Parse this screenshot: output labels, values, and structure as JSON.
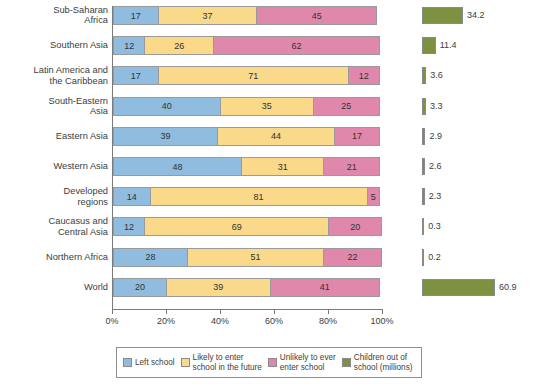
{
  "chart_data": {
    "type": "bar",
    "orientation": "horizontal",
    "subtype": "100% stacked bar with companion magnitude bars",
    "title": "",
    "xlabel": "",
    "ylabel": "",
    "xlim": [
      0,
      100
    ],
    "xticks": [
      "0%",
      "20%",
      "40%",
      "60%",
      "80%",
      "100%"
    ],
    "xtick_values": [
      0,
      20,
      40,
      60,
      80,
      100
    ],
    "grid": false,
    "legend_position": "bottom",
    "categories": [
      "Sub-Saharan\nAfrica",
      "Southern Asia",
      "Latin America and\nthe Caribbean",
      "South-Eastern\nAsia",
      "Eastern Asia",
      "Western Asia",
      "Developed\nregions",
      "Caucasus and\nCentral Asia",
      "Northern Africa",
      "World"
    ],
    "series": [
      {
        "name": "Left school",
        "color": "#8fbcdf",
        "values": [
          17,
          12,
          17,
          40,
          39,
          48,
          14,
          12,
          28,
          20
        ]
      },
      {
        "name": "Likely to enter\nschool in the future",
        "color": "#fad98a",
        "values": [
          37,
          26,
          71,
          35,
          44,
          31,
          81,
          69,
          51,
          39
        ]
      },
      {
        "name": "Unlikely to ever\nenter school",
        "color": "#e088ab",
        "values": [
          45,
          62,
          12,
          25,
          17,
          21,
          5,
          20,
          22,
          41
        ]
      },
      {
        "name": "Children out of\nschool (millions)",
        "color": "#7d9140",
        "axis": "secondary",
        "unit": "millions",
        "values": [
          34.2,
          11.4,
          3.6,
          3.3,
          2.9,
          2.6,
          2.3,
          0.3,
          0.2,
          60.9
        ]
      }
    ]
  },
  "legend": {
    "items": [
      {
        "label": "Left school",
        "swatch": "sw-left"
      },
      {
        "label": "Likely to enter\nschool in the future",
        "swatch": "sw-future"
      },
      {
        "label": "Unlikely to ever\nenter school",
        "swatch": "sw-unlikely"
      },
      {
        "label": "Children out of\nschool (millions)",
        "swatch": "sw-green"
      }
    ]
  }
}
